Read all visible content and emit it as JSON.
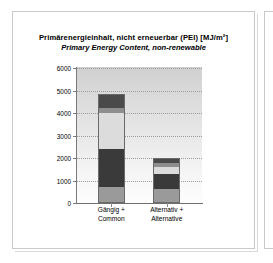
{
  "page": {
    "frame_color": "#c9c9c9",
    "background": "#ffffff"
  },
  "chart_data": {
    "type": "bar",
    "subtype": "stacked-column",
    "title": "Primärenergieinhalt, nicht erneuerbar (PEI) [MJ/m²]",
    "subtitle": "Primary Energy Content, non-renewable",
    "xlabel": "",
    "ylabel": "",
    "ylim": [
      0,
      6000
    ],
    "ytick_labels": [
      "6000",
      "5000",
      "4000",
      "3000",
      "2000",
      "1000",
      "0"
    ],
    "yticks": [
      6000,
      5000,
      4000,
      3000,
      2000,
      1000,
      0
    ],
    "grid": true,
    "legend": "none",
    "categories": [
      "Gängig + Common",
      "Alternativ + Alternative"
    ],
    "category_labels": [
      {
        "line1": "Gängig +",
        "line2": "Common"
      },
      {
        "line1": "Alternativ +",
        "line2": "Alternative"
      }
    ],
    "series": [
      {
        "name": "segment-1",
        "color": "#9a9a9a",
        "values": [
          700,
          640
        ]
      },
      {
        "name": "segment-2",
        "color": "#3a3a3a",
        "values": [
          1720,
          640
        ]
      },
      {
        "name": "segment-3",
        "color": "#dcdcdc",
        "values": [
          1560,
          320
        ]
      },
      {
        "name": "segment-4",
        "color": "#8e8e8e",
        "values": [
          260,
          170
        ]
      },
      {
        "name": "segment-5",
        "color": "#4a4a4a",
        "values": [
          610,
          230
        ]
      }
    ],
    "totals": [
      4850,
      2000
    ],
    "bar_colors": [
      "#9a9a9a",
      "#3a3a3a",
      "#dcdcdc",
      "#8e8e8e",
      "#4a4a4a"
    ],
    "plot_background_top": "#d0d0d0",
    "plot_background_bottom": "#fdfdfd",
    "gridline_color": "#9a9a9a",
    "axis_color": "#7a7a7a"
  }
}
